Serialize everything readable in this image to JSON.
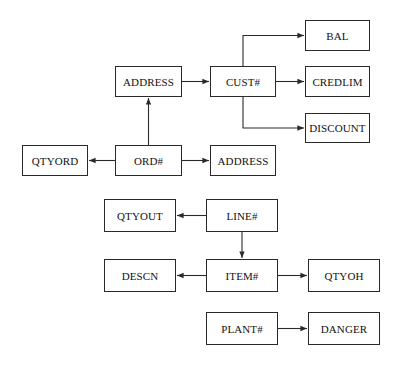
{
  "diagram": {
    "type": "functional-dependency-diagram",
    "colors": {
      "stroke": "#2a2a2a",
      "text": "#111111",
      "background": "#ffffff"
    },
    "nodes": [
      {
        "id": "address_top",
        "label": "ADDRESS",
        "x": 115,
        "y": 66,
        "w": 67,
        "h": 31
      },
      {
        "id": "cust",
        "label": "CUST#",
        "x": 210,
        "y": 66,
        "w": 66,
        "h": 31
      },
      {
        "id": "bal",
        "label": "BAL",
        "x": 305,
        "y": 20,
        "w": 65,
        "h": 31
      },
      {
        "id": "credlim",
        "label": "CREDLIM",
        "x": 305,
        "y": 66,
        "w": 65,
        "h": 31
      },
      {
        "id": "discount",
        "label": "DISCOUNT",
        "x": 305,
        "y": 113,
        "w": 65,
        "h": 30
      },
      {
        "id": "qtyord",
        "label": "QTYORD",
        "x": 22,
        "y": 145,
        "w": 66,
        "h": 31
      },
      {
        "id": "ord",
        "label": "ORD#",
        "x": 115,
        "y": 145,
        "w": 67,
        "h": 31
      },
      {
        "id": "address_mid",
        "label": "ADDRESS",
        "x": 210,
        "y": 145,
        "w": 66,
        "h": 31
      },
      {
        "id": "qtyout",
        "label": "QTYOUT",
        "x": 104,
        "y": 199,
        "w": 72,
        "h": 33
      },
      {
        "id": "line",
        "label": "LINE#",
        "x": 206,
        "y": 199,
        "w": 72,
        "h": 33
      },
      {
        "id": "descn",
        "label": "DESCN",
        "x": 104,
        "y": 259,
        "w": 72,
        "h": 33
      },
      {
        "id": "item",
        "label": "ITEM#",
        "x": 206,
        "y": 259,
        "w": 72,
        "h": 33
      },
      {
        "id": "qtyoh",
        "label": "QTYOH",
        "x": 308,
        "y": 259,
        "w": 72,
        "h": 33
      },
      {
        "id": "plant",
        "label": "PLANT#",
        "x": 206,
        "y": 312,
        "w": 72,
        "h": 33
      },
      {
        "id": "danger",
        "label": "DANGER",
        "x": 308,
        "y": 312,
        "w": 72,
        "h": 33
      }
    ],
    "edges": [
      {
        "from": "address_top",
        "to": "cust"
      },
      {
        "from": "cust",
        "to": "bal"
      },
      {
        "from": "cust",
        "to": "credlim"
      },
      {
        "from": "cust",
        "to": "discount"
      },
      {
        "from": "ord",
        "to": "address_top"
      },
      {
        "from": "ord",
        "to": "qtyord"
      },
      {
        "from": "ord",
        "to": "address_mid"
      },
      {
        "from": "line",
        "to": "qtyout"
      },
      {
        "from": "line",
        "to": "item"
      },
      {
        "from": "item",
        "to": "descn"
      },
      {
        "from": "item",
        "to": "qtyoh"
      },
      {
        "from": "plant",
        "to": "danger"
      }
    ]
  }
}
